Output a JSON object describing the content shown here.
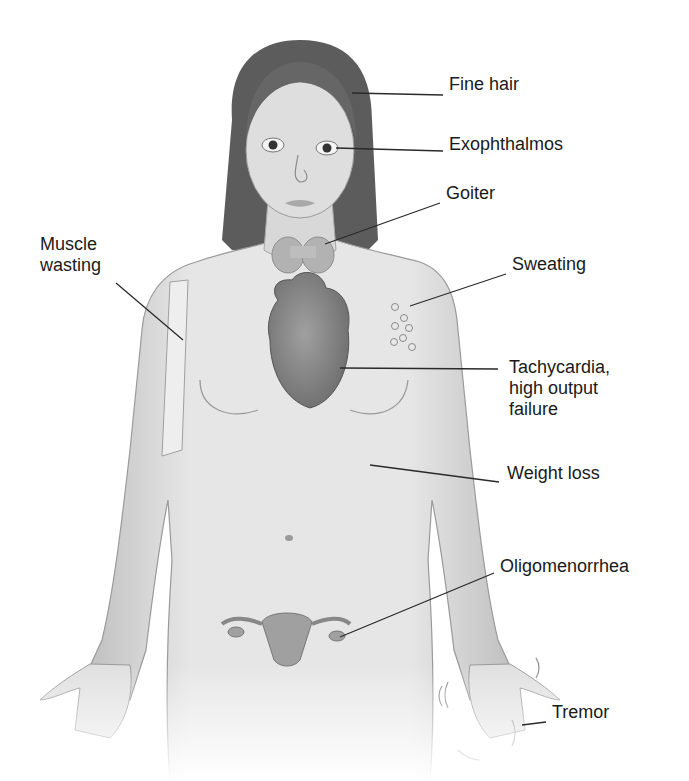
{
  "figure": {
    "type": "anatomical-illustration",
    "colors": {
      "skin": "#dcdcdc",
      "skin_shadow": "#b5b5b5",
      "hair": "#5a5a5a",
      "organ": "#8e8e8e",
      "line": "#2a2a2a",
      "text": "#1a1a1a"
    }
  },
  "labels": [
    {
      "id": "fine-hair",
      "text": "Fine hair",
      "x": 449,
      "y": 84,
      "line": [
        352,
        93,
        443,
        95
      ]
    },
    {
      "id": "exophthalmos",
      "text": "Exophthalmos",
      "x": 449,
      "y": 144,
      "line": [
        336,
        148,
        443,
        151
      ]
    },
    {
      "id": "goiter",
      "text": "Goiter",
      "x": 446,
      "y": 193,
      "line": [
        325,
        244,
        440,
        203
      ]
    },
    {
      "id": "muscle-wasting",
      "text": "Muscle\nwasting",
      "x": 40,
      "y": 244,
      "line": [
        116,
        283,
        183,
        340
      ]
    },
    {
      "id": "sweating",
      "text": "Sweating",
      "x": 512,
      "y": 264,
      "line": [
        410,
        306,
        506,
        274
      ]
    },
    {
      "id": "tachycardia",
      "text": "Tachycardia,\nhigh output\nfailure",
      "x": 509,
      "y": 367,
      "line": [
        340,
        368,
        498,
        369
      ]
    },
    {
      "id": "weight-loss",
      "text": "Weight loss",
      "x": 507,
      "y": 473,
      "line": [
        370,
        465,
        499,
        482
      ]
    },
    {
      "id": "oligomenorrhea",
      "text": "Oligomenorrhea",
      "x": 500,
      "y": 566,
      "line": [
        340,
        637,
        494,
        573
      ]
    },
    {
      "id": "tremor",
      "text": "Tremor",
      "x": 552,
      "y": 712,
      "line": [
        522,
        725,
        546,
        722
      ]
    }
  ]
}
